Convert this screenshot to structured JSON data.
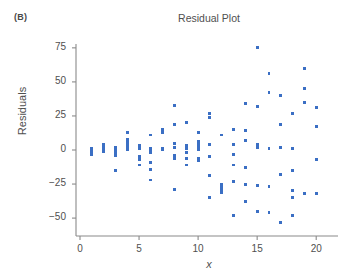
{
  "panel": {
    "label": "(B)"
  },
  "chart_data": {
    "type": "scatter",
    "title": "Residual Plot",
    "xlabel": "x",
    "ylabel": "Residuals",
    "xlim": [
      0,
      21.2
    ],
    "ylim": [
      -57,
      82
    ],
    "grid": false,
    "legend": null,
    "marker_color": "#3b6fc4",
    "axis_color": "#8a8a8a",
    "text_color": "#4f4f4f",
    "xticks": [
      0,
      5,
      10,
      15,
      20
    ],
    "xticklabels": [
      "0",
      "5",
      "10",
      "15",
      "20"
    ],
    "yticks": [
      -50,
      -25,
      0,
      25,
      50,
      75
    ],
    "yticklabels": [
      "-50",
      "-25",
      "0",
      "25",
      "50",
      "75"
    ],
    "points": [
      [
        1,
        1
      ],
      [
        1,
        -1
      ],
      [
        1,
        -3
      ],
      [
        1,
        0
      ],
      [
        2,
        4
      ],
      [
        2,
        2
      ],
      [
        2,
        1
      ],
      [
        2,
        -1
      ],
      [
        2,
        3
      ],
      [
        3,
        2
      ],
      [
        3,
        0
      ],
      [
        3,
        -2
      ],
      [
        3,
        -4
      ],
      [
        3,
        -15
      ],
      [
        4,
        13
      ],
      [
        4,
        8
      ],
      [
        4,
        6
      ],
      [
        4,
        4
      ],
      [
        4,
        2
      ],
      [
        4,
        0
      ],
      [
        5,
        3
      ],
      [
        5,
        1
      ],
      [
        5,
        -5
      ],
      [
        5,
        -7
      ],
      [
        5,
        -11
      ],
      [
        6,
        11
      ],
      [
        6,
        1
      ],
      [
        6,
        0
      ],
      [
        6,
        -2
      ],
      [
        6,
        -9
      ],
      [
        6,
        -14
      ],
      [
        6,
        -22
      ],
      [
        7,
        15
      ],
      [
        7,
        13
      ],
      [
        7,
        1
      ],
      [
        7,
        0
      ],
      [
        8,
        33
      ],
      [
        8,
        19
      ],
      [
        8,
        5
      ],
      [
        8,
        2
      ],
      [
        8,
        -4
      ],
      [
        8,
        -6
      ],
      [
        8,
        -29
      ],
      [
        9,
        20
      ],
      [
        9,
        3
      ],
      [
        9,
        1
      ],
      [
        9,
        -2
      ],
      [
        9,
        -6
      ],
      [
        9,
        -11
      ],
      [
        10,
        13
      ],
      [
        10,
        6
      ],
      [
        10,
        4
      ],
      [
        10,
        2
      ],
      [
        10,
        0
      ],
      [
        10,
        -6
      ],
      [
        10,
        -8
      ],
      [
        11,
        27
      ],
      [
        11,
        24
      ],
      [
        11,
        4
      ],
      [
        11,
        -5
      ],
      [
        11,
        -19
      ],
      [
        11,
        -35
      ],
      [
        12,
        11
      ],
      [
        12,
        -25
      ],
      [
        12,
        -27
      ],
      [
        12,
        -29
      ],
      [
        12,
        -31
      ],
      [
        13,
        15
      ],
      [
        13,
        4
      ],
      [
        13,
        -3
      ],
      [
        13,
        -11
      ],
      [
        13,
        -23
      ],
      [
        13,
        -48
      ],
      [
        14,
        34
      ],
      [
        14,
        14
      ],
      [
        14,
        7
      ],
      [
        14,
        -13
      ],
      [
        14,
        -25
      ],
      [
        14,
        -38
      ],
      [
        15,
        75
      ],
      [
        15,
        32
      ],
      [
        15,
        4
      ],
      [
        15,
        2
      ],
      [
        15,
        -26
      ],
      [
        15,
        -45
      ],
      [
        16,
        56
      ],
      [
        16,
        42
      ],
      [
        16,
        1
      ],
      [
        16,
        -27
      ],
      [
        16,
        -46
      ],
      [
        17,
        40
      ],
      [
        17,
        19
      ],
      [
        17,
        2
      ],
      [
        17,
        -18
      ],
      [
        17,
        -53
      ],
      [
        18,
        27
      ],
      [
        18,
        1
      ],
      [
        18,
        -15
      ],
      [
        18,
        -30
      ],
      [
        18,
        -35
      ],
      [
        18,
        -48
      ],
      [
        19,
        60
      ],
      [
        19,
        45
      ],
      [
        19,
        35
      ],
      [
        19,
        -32
      ],
      [
        20,
        31
      ],
      [
        20,
        17
      ],
      [
        20,
        -7
      ],
      [
        20,
        -32
      ]
    ]
  }
}
